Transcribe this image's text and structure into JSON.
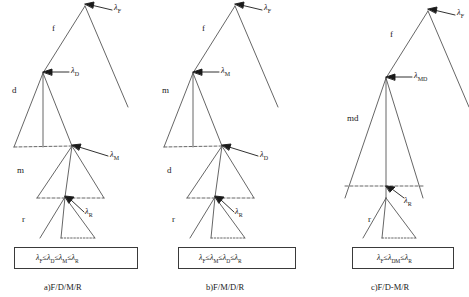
{
  "figure": {
    "type": "phylogenetic-rate-trees",
    "width": 469,
    "height": 297,
    "line_color": "#555555",
    "text_color": "#1a1a1a"
  },
  "panels": [
    {
      "id": "a",
      "caption": "a)F/D/M/R",
      "level_labels": [
        "f",
        "d",
        "m",
        "r"
      ],
      "rate_labels": [
        "λ",
        "λ",
        "λ",
        "λ"
      ],
      "rate_subscripts": [
        "F",
        "D",
        "M",
        "R"
      ],
      "formula": "λ",
      "formula_parts": [
        {
          "sym": "λ",
          "sub": "F"
        },
        {
          "op": "≤"
        },
        {
          "sym": "λ",
          "sub": "D"
        },
        {
          "op": "≤"
        },
        {
          "sym": "λ",
          "sub": "M"
        },
        {
          "op": "≤"
        },
        {
          "sym": "λ",
          "sub": "R"
        }
      ],
      "formula_text": "λF ≤ λD ≤ λM ≤ λR"
    },
    {
      "id": "b",
      "caption": "b)F/M/D/R",
      "level_labels": [
        "f",
        "m",
        "d",
        "r"
      ],
      "rate_labels": [
        "λ",
        "λ",
        "λ",
        "λ"
      ],
      "rate_subscripts": [
        "F",
        "M",
        "D",
        "R"
      ],
      "formula_parts": [
        {
          "sym": "λ",
          "sub": "F"
        },
        {
          "op": "≤"
        },
        {
          "sym": "λ",
          "sub": "M"
        },
        {
          "op": "≤"
        },
        {
          "sym": "λ",
          "sub": "D"
        },
        {
          "op": "≤"
        },
        {
          "sym": "λ",
          "sub": "R"
        }
      ],
      "formula_text": "λF ≤ λM ≤ λD ≤ λR"
    },
    {
      "id": "c",
      "caption": "c)F/D-M/R",
      "level_labels": [
        "f",
        "md",
        "r"
      ],
      "rate_labels": [
        "λ",
        "λ",
        "λ"
      ],
      "rate_subscripts": [
        "F",
        "MD",
        "R"
      ],
      "formula_parts": [
        {
          "sym": "λ",
          "sub": "F"
        },
        {
          "op": "≤"
        },
        {
          "sym": "λ",
          "sub": "DM"
        },
        {
          "op": "≤"
        },
        {
          "sym": "λ",
          "sub": "R"
        }
      ],
      "formula_text": "λF ≤ λDM ≤ λR"
    }
  ],
  "glyphs": {
    "lambda": "λ",
    "leq": "≤"
  }
}
